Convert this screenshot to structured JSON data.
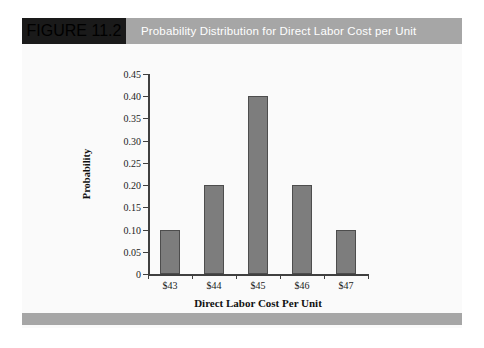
{
  "figure": {
    "number_label": "FIGURE 11.2",
    "title": "Probability Distribution for Direct Labor Cost per Unit",
    "header_bg": "#a6a6a6",
    "number_block_bg": "#1a1a1a",
    "body_bg": "#fafafa",
    "footer_bg": "#a6a6a6"
  },
  "chart_data": {
    "type": "bar",
    "title": "Probability Distribution for Direct Labor Cost per Unit",
    "categories": [
      "$43",
      "$44",
      "$45",
      "$46",
      "$47"
    ],
    "values": [
      0.1,
      0.2,
      0.4,
      0.2,
      0.1
    ],
    "xlabel": "Direct Labor Cost Per Unit",
    "ylabel": "Probability",
    "ylim": [
      0,
      0.45
    ],
    "ytick_labels": [
      "0",
      "0.05",
      "0.10",
      "0.15",
      "0.20",
      "0.25",
      "0.30",
      "0.35",
      "0.40",
      "0.45"
    ],
    "ytick_values": [
      0,
      0.05,
      0.1,
      0.15,
      0.2,
      0.25,
      0.3,
      0.35,
      0.4,
      0.45
    ],
    "grid": false,
    "legend": false,
    "bar_color": "#7d7d7d",
    "bar_edge_color": "#4d4d4d",
    "axis_color": "#404040"
  }
}
